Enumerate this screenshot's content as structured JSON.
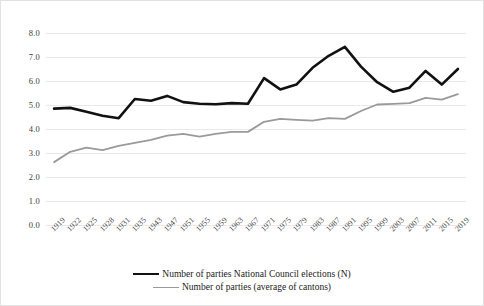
{
  "chart_data": {
    "type": "line",
    "title": "",
    "xlabel": "",
    "ylabel": "",
    "ylim": [
      0.0,
      8.0
    ],
    "ytick_step": 1.0,
    "ytick_labels": [
      "8.0",
      "7.0",
      "6.0",
      "5.0",
      "4.0",
      "3.0",
      "2.0",
      "1.0",
      "0.0"
    ],
    "grid": "horizontal",
    "legend_position": "bottom-center",
    "categories": [
      "1919",
      "1922",
      "1925",
      "1928",
      "1931",
      "1935",
      "1943",
      "1947",
      "1951",
      "1955",
      "1959",
      "1963",
      "1967",
      "1971",
      "1975",
      "1979",
      "1983",
      "1987",
      "1991",
      "1995",
      "1999",
      "2003",
      "2007",
      "2011",
      "2015",
      "2019"
    ],
    "series": [
      {
        "name": "Number of parties National Council elections (N)",
        "color": "#111111",
        "width": 2.6,
        "values": [
          4.85,
          4.88,
          4.72,
          4.55,
          4.45,
          5.25,
          5.18,
          5.38,
          5.12,
          5.05,
          5.03,
          5.08,
          5.05,
          6.12,
          5.65,
          5.85,
          6.55,
          7.05,
          7.42,
          6.6,
          5.95,
          5.55,
          5.72,
          6.42,
          5.85,
          6.5
        ]
      },
      {
        "name": "Number of parties (average of cantons)",
        "color": "#9a9a9a",
        "width": 1.8,
        "values": [
          2.62,
          3.05,
          3.22,
          3.12,
          3.3,
          3.42,
          3.55,
          3.72,
          3.8,
          3.68,
          3.8,
          3.88,
          3.88,
          4.3,
          4.42,
          4.38,
          4.35,
          4.45,
          4.42,
          4.75,
          5.02,
          5.05,
          5.08,
          5.3,
          5.22,
          5.45
        ]
      }
    ]
  },
  "legend": {
    "items": [
      {
        "label": "Number of parties National Council elections (N)",
        "style": "black"
      },
      {
        "label": "Number of parties (average of cantons)",
        "style": "grey"
      }
    ]
  }
}
